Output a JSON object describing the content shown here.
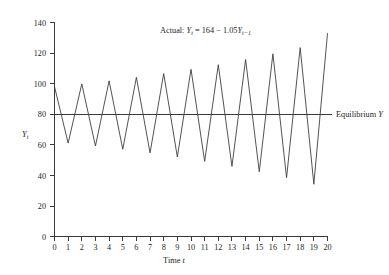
{
  "chart_data": {
    "type": "line",
    "title": "",
    "xlabel": "Time t",
    "ylabel": "Y_t",
    "xlim": [
      0,
      20
    ],
    "ylim": [
      0,
      140
    ],
    "grid": false,
    "legend_position": "none",
    "x": [
      0,
      1,
      2,
      3,
      4,
      5,
      6,
      7,
      8,
      9,
      10,
      11,
      12,
      13,
      14,
      15,
      16,
      17,
      18,
      19,
      20
    ],
    "series": [
      {
        "name": "Actual",
        "formula": "Y_t = 164 - 1.05Y_{t-1}",
        "values": [
          98.0,
          61.1,
          99.8,
          59.2,
          101.8,
          57.1,
          104.1,
          54.7,
          106.6,
          52.0,
          109.4,
          49.1,
          112.4,
          45.9,
          115.8,
          42.4,
          119.5,
          38.5,
          123.6,
          34.2,
          128.1
        ]
      },
      {
        "name": "Equilibrium Y",
        "values": [
          80,
          80,
          80,
          80,
          80,
          80,
          80,
          80,
          80,
          80,
          80,
          80,
          80,
          80,
          80,
          80,
          80,
          80,
          80,
          80,
          80
        ]
      }
    ],
    "y_ticks": [
      0,
      20,
      40,
      60,
      80,
      100,
      120,
      140
    ],
    "x_ticks": [
      0,
      1,
      2,
      3,
      4,
      5,
      6,
      7,
      8,
      9,
      10,
      11,
      12,
      13,
      14,
      15,
      16,
      17,
      18,
      19,
      20
    ],
    "annotations": [
      {
        "name": "actual-equation",
        "prefix": "Actual: ",
        "var1": "Y",
        "sub1": "t",
        "mid": " = 164 − 1.05",
        "var2": "Y",
        "sub2": "t−1",
        "full_text": "Actual: Yt = 164 − 1.05Yt−1"
      },
      {
        "name": "equilibrium-label",
        "text": "Equilibrium ",
        "italic_part": "Y",
        "full_text": "Equilibrium Y"
      }
    ],
    "colors": {
      "series_line": "#3f3f3f",
      "equilibrium_line": "#3a3a3a",
      "axis": "#3a3a3a",
      "text": "#231f20",
      "background": "#ffffff"
    }
  },
  "axes": {
    "y_tick_labels": [
      "0",
      "20",
      "40",
      "60",
      "80",
      "100",
      "120",
      "140"
    ],
    "x_tick_labels": [
      "0",
      "1",
      "2",
      "3",
      "4",
      "5",
      "6",
      "7",
      "8",
      "9",
      "10",
      "11",
      "12",
      "13",
      "14",
      "15",
      "16",
      "17",
      "18",
      "19",
      "20"
    ],
    "y_axis_title_var": "Y",
    "y_axis_title_sub": "t",
    "x_axis_title_main": "Time ",
    "x_axis_title_var": "t"
  }
}
